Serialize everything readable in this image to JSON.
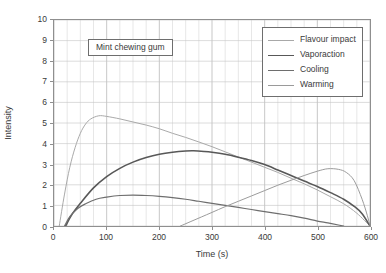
{
  "chart_data": {
    "type": "line",
    "title": "",
    "annotation": "Mint chewing gum",
    "xlabel": "Time (s)",
    "ylabel": "Intensity",
    "xlim": [
      0,
      600
    ],
    "ylim": [
      0,
      10
    ],
    "xticks": [
      0,
      100,
      200,
      300,
      400,
      500,
      600
    ],
    "yticks": [
      0,
      1,
      2,
      3,
      4,
      5,
      6,
      7,
      8,
      9,
      10
    ],
    "grid": true,
    "grid_minor_x_step": 25,
    "grid_major_y_step": 1,
    "legend_position": "top-right",
    "series": [
      {
        "name": "Flavour impact",
        "color": "#a8a8a8",
        "width": 1.0,
        "x": [
          10,
          20,
          30,
          40,
          50,
          60,
          70,
          85,
          100,
          125,
          150,
          175,
          200,
          225,
          250,
          275,
          300,
          325,
          350,
          375,
          400,
          425,
          450,
          475,
          500,
          525,
          550,
          575,
          600
        ],
        "y": [
          0.0,
          1.55,
          2.85,
          3.8,
          4.5,
          4.95,
          5.2,
          5.35,
          5.32,
          5.2,
          5.05,
          4.9,
          4.72,
          4.5,
          4.3,
          4.08,
          3.85,
          3.6,
          3.35,
          3.1,
          2.85,
          2.6,
          2.32,
          2.05,
          1.75,
          1.42,
          1.08,
          0.62,
          0.0
        ]
      },
      {
        "name": "Vaporaction",
        "color": "#585858",
        "width": 1.6,
        "x": [
          22,
          35,
          50,
          75,
          100,
          125,
          150,
          175,
          200,
          225,
          250,
          265,
          285,
          300,
          325,
          350,
          375,
          400,
          425,
          450,
          475,
          500,
          525,
          550,
          570,
          585,
          600
        ],
        "y": [
          0.0,
          0.6,
          1.1,
          1.85,
          2.4,
          2.8,
          3.1,
          3.32,
          3.48,
          3.58,
          3.64,
          3.65,
          3.62,
          3.58,
          3.48,
          3.34,
          3.18,
          2.98,
          2.72,
          2.45,
          2.18,
          1.92,
          1.62,
          1.3,
          0.95,
          0.6,
          0.0
        ]
      },
      {
        "name": "Cooling",
        "color": "#6e6e6e",
        "width": 1.2,
        "x": [
          20,
          30,
          45,
          60,
          80,
          100,
          125,
          150,
          175,
          200,
          225,
          250,
          275,
          300,
          325,
          350,
          375,
          400,
          425,
          450,
          475,
          500,
          520,
          540,
          550
        ],
        "y": [
          0.0,
          0.45,
          0.85,
          1.08,
          1.3,
          1.4,
          1.48,
          1.5,
          1.48,
          1.44,
          1.38,
          1.3,
          1.2,
          1.1,
          1.0,
          0.9,
          0.8,
          0.7,
          0.6,
          0.5,
          0.38,
          0.24,
          0.15,
          0.05,
          0.0
        ]
      },
      {
        "name": "Warming",
        "color": "#9a9a9a",
        "width": 1.0,
        "x": [
          240,
          260,
          280,
          300,
          325,
          350,
          375,
          400,
          425,
          450,
          475,
          500,
          520,
          540,
          555,
          570,
          585,
          595,
          600
        ],
        "y": [
          0.0,
          0.22,
          0.44,
          0.66,
          0.94,
          1.2,
          1.46,
          1.72,
          1.98,
          2.22,
          2.45,
          2.66,
          2.78,
          2.75,
          2.6,
          2.2,
          1.3,
          0.5,
          0.0
        ]
      }
    ]
  },
  "legend": {
    "items": [
      {
        "label": "Flavour impact"
      },
      {
        "label": "Vaporaction"
      },
      {
        "label": "Cooling"
      },
      {
        "label": "Warming"
      }
    ]
  }
}
